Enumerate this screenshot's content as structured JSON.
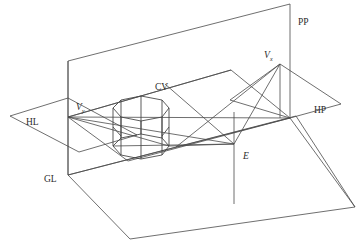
{
  "figure": {
    "kind": "perspective-projection-construction-diagram",
    "background_color": "#ffffff",
    "line_color": "#4a4a4a",
    "label_color": "#2b2b2b"
  },
  "labels": {
    "picture_plane": "PP",
    "horizon_line": "HL",
    "ground_line": "GL",
    "horizontal_plane": "HP",
    "center_of_vision": "CV",
    "eye_point": "E",
    "vanishing_point_left": "V",
    "vanishing_point_left_sub": "y",
    "vanishing_point_right": "V",
    "vanishing_point_right_sub": "x"
  },
  "points": {
    "E": {
      "x": 234,
      "y": 144
    },
    "VP_left": {
      "x": 68,
      "y": 117
    },
    "VP_right": {
      "x": 280,
      "y": 64
    },
    "CV": {
      "x": 165,
      "y": 84
    }
  },
  "object": {
    "name": "octagonal-prism",
    "sides": 8,
    "center_x": 141,
    "center_y": 132,
    "radius_x": 28,
    "radius_y": 11,
    "height": 38
  },
  "planes": {
    "picture_plane_label_pos": {
      "x": 298,
      "y": 22
    },
    "horizon_plane_label_pos": {
      "x": 26,
      "y": 122
    },
    "ground_label_pos": {
      "x": 44,
      "y": 179
    },
    "horizontal_plane_label_pos": {
      "x": 318,
      "y": 110
    },
    "center_vision_label_pos": {
      "x": 156,
      "y": 89
    },
    "eye_label_pos": {
      "x": 243,
      "y": 156
    }
  }
}
